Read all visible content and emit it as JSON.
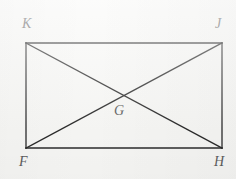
{
  "figure": {
    "kind": "geometry-diagram",
    "canvas": {
      "width": 236,
      "height": 179
    },
    "background_color": "#f7f7f5",
    "stroke_color": "#2b2b2b",
    "stroke_width": 1.3,
    "label_color": "#5d5d5d",
    "rectangle": {
      "name": "rectangle-FHJK",
      "top_left": {
        "x": 26,
        "y": 43
      },
      "top_right": {
        "x": 222,
        "y": 43
      },
      "bottom_right": {
        "x": 222,
        "y": 148
      },
      "bottom_left": {
        "x": 26,
        "y": 148
      }
    },
    "diagonals": [
      {
        "name": "diagonal-K-H",
        "from": {
          "x": 26,
          "y": 43
        },
        "to": {
          "x": 222,
          "y": 148
        }
      },
      {
        "name": "diagonal-F-J",
        "from": {
          "x": 26,
          "y": 148
        },
        "to": {
          "x": 222,
          "y": 43
        }
      }
    ],
    "intersection": {
      "name": "point-G",
      "x": 124,
      "y": 95.5
    },
    "labels": [
      {
        "id": "K",
        "text": "K",
        "x": 22,
        "y": 17,
        "corner": "top-left"
      },
      {
        "id": "J",
        "text": "J",
        "x": 215,
        "y": 17,
        "corner": "top-right"
      },
      {
        "id": "G",
        "text": "G",
        "x": 114,
        "y": 104,
        "corner": "center"
      },
      {
        "id": "F",
        "text": "F",
        "x": 19,
        "y": 155,
        "corner": "bottom-left"
      },
      {
        "id": "H",
        "text": "H",
        "x": 214,
        "y": 155,
        "corner": "bottom-right"
      }
    ]
  }
}
